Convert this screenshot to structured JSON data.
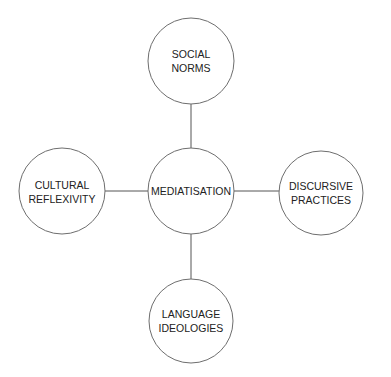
{
  "diagram": {
    "type": "concept-map",
    "center": {
      "id": "mediatisation",
      "lines": [
        "MEDIATISATION"
      ]
    },
    "nodes": [
      {
        "id": "social-norms",
        "position": "top",
        "lines": [
          "SOCIAL",
          "NORMS"
        ]
      },
      {
        "id": "cultural-reflexivity",
        "position": "left",
        "lines": [
          "CULTURAL",
          "REFLEXIVITY"
        ]
      },
      {
        "id": "discursive-practices",
        "position": "right",
        "lines": [
          "DISCURSIVE",
          "PRACTICES"
        ]
      },
      {
        "id": "language-ideologies",
        "position": "bottom",
        "lines": [
          "LANGUAGE",
          "IDEOLOGIES"
        ]
      }
    ],
    "edges": [
      {
        "from": "mediatisation",
        "to": "social-norms"
      },
      {
        "from": "mediatisation",
        "to": "cultural-reflexivity"
      },
      {
        "from": "mediatisation",
        "to": "discursive-practices"
      },
      {
        "from": "mediatisation",
        "to": "language-ideologies"
      }
    ],
    "colors": {
      "stroke": "#6e6e6e",
      "text": "#222222",
      "background": "#ffffff"
    }
  }
}
